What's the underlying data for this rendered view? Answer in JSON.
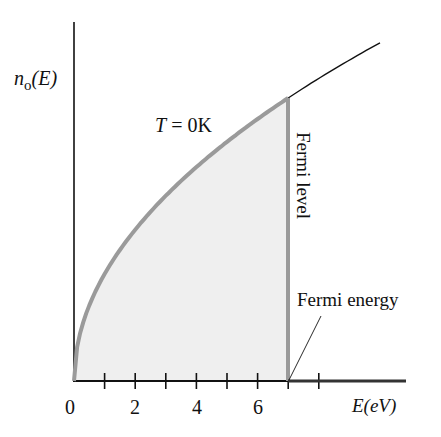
{
  "chart_data": {
    "type": "line",
    "title": "",
    "xlabel": "E(eV)",
    "ylabel": "n_o(E)",
    "xlim": [
      0,
      10.5
    ],
    "x_ticks": [
      0,
      1,
      2,
      3,
      4,
      5,
      6,
      7,
      8
    ],
    "x_tick_labels": [
      "0",
      "2",
      "4",
      "6"
    ],
    "x_tick_label_values": [
      0,
      2,
      4,
      6
    ],
    "grid": false,
    "legend": null,
    "series": [
      {
        "name": "n_o(E) at T = 0K (occupied)",
        "function": "proportional to sqrt(E)",
        "x": [
          0,
          1,
          2,
          3,
          4,
          5,
          6,
          7
        ],
        "values": [
          0,
          0.378,
          0.535,
          0.655,
          0.756,
          0.845,
          0.926,
          1.0
        ],
        "style": "thick gray, filled below"
      },
      {
        "name": "density of states continuation",
        "x": [
          7,
          8,
          9,
          10
        ],
        "values": [
          1.0,
          1.069,
          1.134,
          1.195
        ],
        "style": "thin black"
      },
      {
        "name": "n_o(E) above Fermi level",
        "x": [
          7,
          10.5
        ],
        "values": [
          0,
          0
        ],
        "style": "thick dark on axis"
      }
    ],
    "fermi_energy_eV": 7,
    "annotations": [
      "T = 0K",
      "Fermi level",
      "Fermi energy"
    ]
  },
  "labels": {
    "y_axis_main": "n",
    "y_axis_sub": "o",
    "y_axis_rest": "(E)",
    "x_axis": "E(eV)",
    "temperature": "T = 0K",
    "temperature_T": "T",
    "temperature_rest": " = 0K",
    "fermi_level": "Fermi level",
    "fermi_energy": "Fermi energy",
    "tick_0": "0",
    "tick_2": "2",
    "tick_4": "4",
    "tick_6": "6"
  },
  "colors": {
    "axis": "#111111",
    "curve": "#9a9a9a",
    "fill": "#efefef",
    "continuation": "#111111"
  }
}
